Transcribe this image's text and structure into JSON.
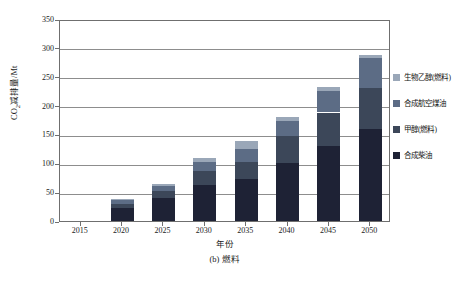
{
  "chart_data": {
    "type": "bar",
    "stacked": true,
    "title": "",
    "caption": "(b) 燃料",
    "xlabel": "年份",
    "ylabel": "CO2减排量/Mt",
    "ylabel_parts": {
      "pre": "CO",
      "sub": "2",
      "post": "减排量/Mt"
    },
    "categories": [
      "2015",
      "2020",
      "2025",
      "2030",
      "2035",
      "2040",
      "2045",
      "2050"
    ],
    "ylim": [
      0,
      350
    ],
    "yticks": [
      0,
      50,
      100,
      150,
      200,
      250,
      300,
      350
    ],
    "grid": "horizontal",
    "legend_position": "right",
    "series": [
      {
        "name": "合成柴油",
        "color": "#1e2235",
        "values": [
          0,
          22,
          40,
          63,
          73,
          100,
          130,
          160
        ]
      },
      {
        "name": "甲醇(燃料)",
        "color": "#3c4759",
        "values": [
          0,
          8,
          12,
          24,
          30,
          48,
          58,
          70
        ]
      },
      {
        "name": "合成航空煤油",
        "color": "#5c6c85",
        "values": [
          0,
          6,
          9,
          16,
          22,
          26,
          38,
          52
        ]
      },
      {
        "name": "生物乙醇(燃料)",
        "color": "#9aa7b8",
        "values": [
          0,
          2,
          4,
          7,
          13,
          6,
          6,
          6
        ]
      }
    ],
    "totals": [
      0,
      38,
      65,
      110,
      138,
      180,
      232,
      288
    ]
  },
  "legend": {
    "items": [
      {
        "label": "生物乙醇(燃料)",
        "color": "#9aa7b8"
      },
      {
        "label": "合成航空煤油",
        "color": "#5c6c85"
      },
      {
        "label": "甲醇(燃料)",
        "color": "#3c4759"
      },
      {
        "label": "合成柴油",
        "color": "#1e2235"
      }
    ]
  }
}
